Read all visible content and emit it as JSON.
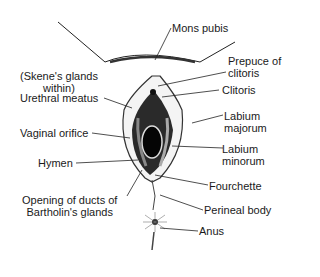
{
  "diagram": {
    "labels": {
      "mons_pubis": "Mons pubis",
      "prepuce_line1": "Prepuce of",
      "prepuce_line2": "clitoris",
      "clitoris": "Clitoris",
      "skene_line1": "(Skene's glands",
      "skene_line2": "within)",
      "urethral_meatus": "Urethral meatus",
      "labium_majorum_line1": "Labium",
      "labium_majorum_line2": "majorum",
      "vaginal_orifice": "Vaginal orifice",
      "labium_minorum_line1": "Labium",
      "labium_minorum_line2": "minorum",
      "hymen": "Hymen",
      "fourchette": "Fourchette",
      "bartholin_line1": "Opening of ducts of",
      "bartholin_line2": "Bartholin's glands",
      "perineal_body": "Perineal body",
      "anus": "Anus"
    },
    "colors": {
      "ink": "#1a1a1a",
      "background": "#ffffff"
    }
  }
}
